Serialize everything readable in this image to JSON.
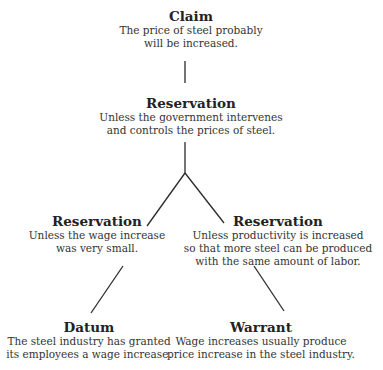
{
  "diagram": {
    "type": "Toulmin argument model",
    "nodes": {
      "claim": {
        "title": "Claim",
        "lines": [
          "The price of steel probably",
          "will be increased."
        ]
      },
      "reservation_main": {
        "title": "Reservation",
        "lines": [
          "Unless the government intervenes",
          "and controls the prices of steel."
        ]
      },
      "reservation_left": {
        "title": "Reservation",
        "lines": [
          "Unless the wage increase",
          "was very small."
        ]
      },
      "reservation_right": {
        "title": "Reservation",
        "lines": [
          "Unless productivity is increased",
          "so that more steel can be produced",
          "with the same amount of labor."
        ]
      },
      "datum": {
        "title": "Datum",
        "lines": [
          "The steel industry has granted",
          "its employees a wage increase."
        ]
      },
      "warrant": {
        "title": "Warrant",
        "lines": [
          "Wage increases usually produce",
          "price increase in the steel industry."
        ]
      }
    },
    "edges": [
      {
        "from": "claim",
        "to": "reservation_main"
      },
      {
        "from": "reservation_main",
        "to": "reservation_left"
      },
      {
        "from": "reservation_main",
        "to": "reservation_right"
      },
      {
        "from": "reservation_left",
        "to": "datum"
      },
      {
        "from": "reservation_right",
        "to": "warrant"
      }
    ],
    "line_color": "#2a2a2a"
  }
}
